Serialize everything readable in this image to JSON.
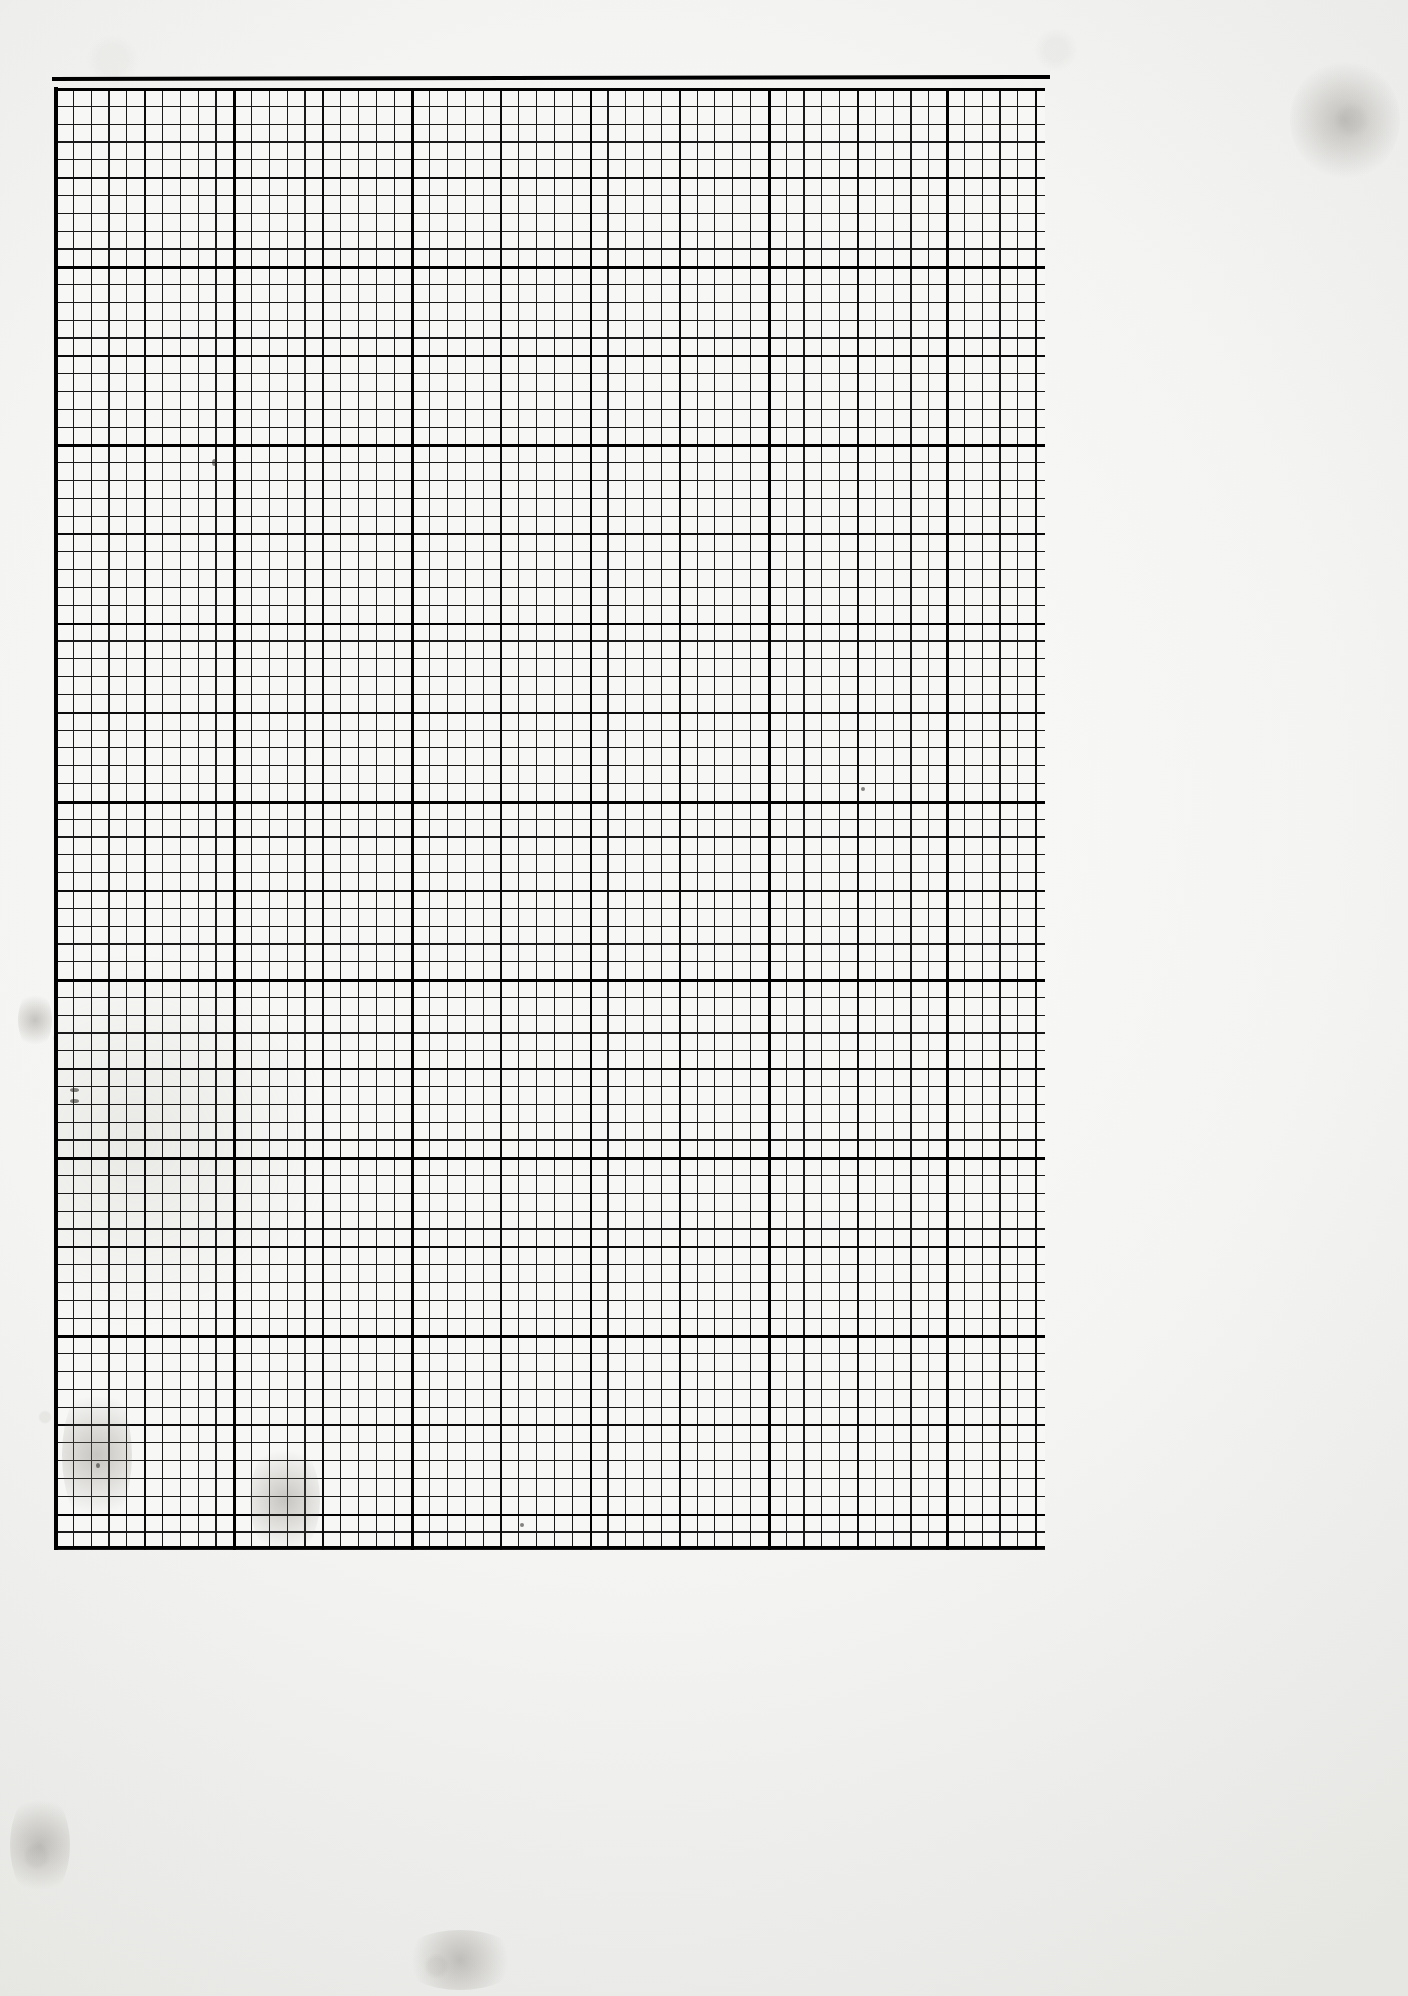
{
  "document": {
    "kind": "scanned-graph-paper",
    "title": "Blank millimeter graph paper sheet",
    "page_width_px": 1408,
    "page_height_px": 1996,
    "paper_color": "#f7f7f5",
    "margin_color": "#f0f0ee",
    "ink_color": "#1a1a1a"
  },
  "grid": {
    "left_px": 55,
    "top_px": 88,
    "width_px": 990,
    "height_px": 1462,
    "fine_cell_px": 17.82,
    "medium_every_n_cells": 5,
    "heavy_every_n_cells": 10,
    "fine_line_px": 1.15,
    "medium_line_px": 1.9,
    "heavy_line_px": 2.8,
    "columns_fine": 55,
    "rows_fine": 82,
    "columns_heavy": 6,
    "rows_heavy": 8,
    "fine_color": "#1a1a1a",
    "medium_color": "#0c0c0c",
    "heavy_color": "#000000"
  },
  "rules": {
    "top": {
      "left_px": 52,
      "top_px": 77,
      "width_px": 998,
      "height_px": 4
    },
    "left": {
      "left_px": 54,
      "top_px": 87,
      "width_px": 4,
      "height_px": 1463
    },
    "bottom": {
      "left_px": 55,
      "top_px": 1546,
      "width_px": 990,
      "height_px": 3
    }
  },
  "artifacts": {
    "stray_marks": [
      {
        "name": "mark-upper-left",
        "x": 212,
        "y": 459,
        "w": 5,
        "h": 7
      },
      {
        "name": "mark-left-edge-upper",
        "x": 70,
        "y": 1088,
        "w": 9,
        "h": 4
      },
      {
        "name": "mark-left-edge-lower",
        "x": 70,
        "y": 1099,
        "w": 9,
        "h": 4
      },
      {
        "name": "mark-mid-right",
        "x": 861,
        "y": 787,
        "w": 4,
        "h": 4
      },
      {
        "name": "mark-lower-left",
        "x": 96,
        "y": 1463,
        "w": 4,
        "h": 5
      },
      {
        "name": "mark-bottom-mid",
        "x": 520,
        "y": 1523,
        "w": 4,
        "h": 4
      }
    ],
    "smudges": [
      {
        "name": "smudge-left-margin-mid",
        "x": 18,
        "y": 990,
        "w": 34,
        "h": 60
      },
      {
        "name": "smudge-left-margin-low",
        "x": 10,
        "y": 1790,
        "w": 60,
        "h": 110
      },
      {
        "name": "smudge-bottom-center",
        "x": 400,
        "y": 1930,
        "w": 120,
        "h": 60
      },
      {
        "name": "smudge-top-right",
        "x": 1290,
        "y": 60,
        "w": 110,
        "h": 120
      },
      {
        "name": "smudge-grid-left-low",
        "x": 62,
        "y": 1380,
        "w": 70,
        "h": 150
      },
      {
        "name": "smudge-grid-pencil-arc",
        "x": 250,
        "y": 1440,
        "w": 70,
        "h": 120
      }
    ]
  }
}
